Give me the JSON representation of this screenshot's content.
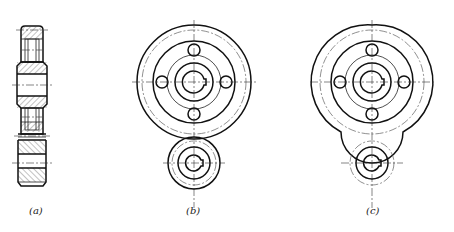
{
  "figure": {
    "panels": [
      {
        "id": "a",
        "label": "(a)",
        "view": "sectional side view of gear pair (hatched)"
      },
      {
        "id": "b",
        "label": "(b)",
        "view": "front view of meshing gears — large gear with four lightening holes, small gear"
      },
      {
        "id": "c",
        "label": "(c)",
        "view": "front view of meshing gears — simplified mesh contour"
      }
    ]
  },
  "colors": {
    "line": "#111111",
    "background": "#ffffff"
  }
}
